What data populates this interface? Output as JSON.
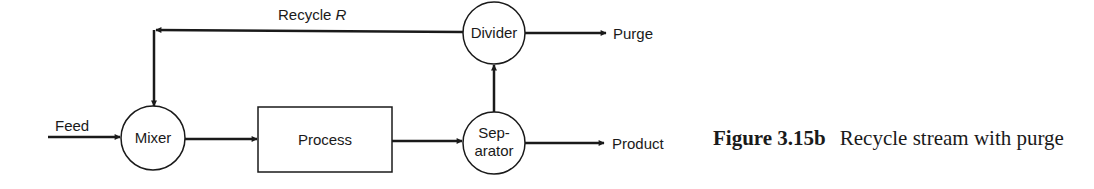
{
  "diagram": {
    "nodes": {
      "mixer": {
        "label": "Mixer",
        "shape": "circle"
      },
      "process": {
        "label": "Process",
        "shape": "rectangle"
      },
      "separator": {
        "label_line1": "Sep-",
        "label_line2": "arator",
        "shape": "circle"
      },
      "divider": {
        "label": "Divider",
        "shape": "circle"
      }
    },
    "streams": {
      "feed": "Feed",
      "recycle": "Recycle",
      "recycle_symbol": "R",
      "purge": "Purge",
      "product": "Product"
    },
    "edges": [
      {
        "from": "feed",
        "to": "mixer"
      },
      {
        "from": "mixer",
        "to": "process"
      },
      {
        "from": "process",
        "to": "separator"
      },
      {
        "from": "separator",
        "to": "product"
      },
      {
        "from": "separator",
        "to": "divider"
      },
      {
        "from": "divider",
        "to": "purge"
      },
      {
        "from": "divider",
        "to": "mixer",
        "label": "Recycle R"
      }
    ]
  },
  "caption": {
    "figure_number": "Figure 3.15b",
    "text": "Recycle stream with purge"
  },
  "colors": {
    "ink": "#1a1a1a",
    "background": "#ffffff"
  }
}
